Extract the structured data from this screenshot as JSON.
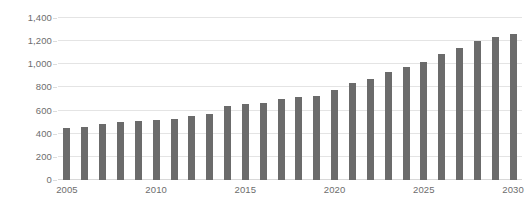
{
  "chart_data": {
    "type": "bar",
    "title": "",
    "subtitle": "",
    "xlabel": "",
    "ylabel": "",
    "categories": [
      "2005",
      "2006",
      "2007",
      "2008",
      "2009",
      "2010",
      "2011",
      "2012",
      "2013",
      "2014",
      "2015",
      "2016",
      "2017",
      "2018",
      "2019",
      "2020",
      "2021",
      "2022",
      "2023",
      "2024",
      "2025",
      "2026",
      "2027",
      "2028",
      "2029",
      "2030"
    ],
    "values": [
      450,
      455,
      480,
      500,
      510,
      520,
      530,
      555,
      570,
      640,
      655,
      665,
      700,
      715,
      730,
      780,
      840,
      870,
      930,
      975,
      1020,
      1090,
      1145,
      1200,
      1235,
      1265
    ],
    "series": [
      {
        "name": "",
        "values": [
          450,
          455,
          480,
          500,
          510,
          520,
          530,
          555,
          570,
          640,
          655,
          665,
          700,
          715,
          730,
          780,
          840,
          870,
          930,
          975,
          1020,
          1090,
          1145,
          1200,
          1235,
          1265
        ]
      }
    ],
    "ylim": [
      0,
      1400
    ],
    "yticks": [
      0,
      200,
      400,
      600,
      800,
      1000,
      1200,
      1400
    ],
    "ytick_labels": [
      "0",
      "200",
      "400",
      "600",
      "800",
      "1,000",
      "1,200",
      "1,400"
    ],
    "xtick_labels": [
      "2005",
      "2010",
      "2015",
      "2020",
      "2025",
      "2030"
    ],
    "xtick_categories": [
      "2005",
      "2010",
      "2015",
      "2020",
      "2025",
      "2030"
    ],
    "grid": true,
    "grid_axis": "y",
    "legend": false,
    "legend_position": "none",
    "bar_color": "#6b6b6b",
    "grid_color": "#e4e4e4",
    "axis_text_color": "#6d6d6d",
    "background_color": "#ffffff"
  }
}
